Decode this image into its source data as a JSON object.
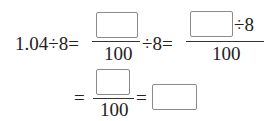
{
  "equation": {
    "row1": {
      "lhs": "1.04÷8=",
      "frac1_den": "100",
      "op1": "÷8=",
      "frac2_num_suffix": "÷8",
      "frac2_den": "100"
    },
    "row2": {
      "eq1": "=",
      "frac3_den": "100",
      "eq2": "="
    }
  }
}
